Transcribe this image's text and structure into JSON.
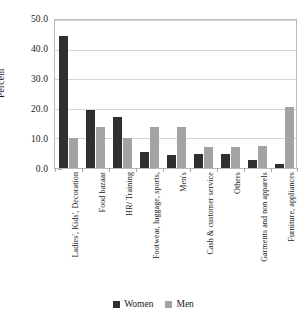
{
  "chart_data": {
    "type": "bar",
    "title": "",
    "xlabel": "",
    "ylabel": "Percent",
    "ylim": [
      0,
      50
    ],
    "ytick_step": 10,
    "ytick_labels": [
      "0.0",
      "10.0",
      "20.0",
      "30.0",
      "40.0",
      "50.0"
    ],
    "grid": true,
    "legend_position": "bottom",
    "categories": [
      "Ladies', Kids', Decoration",
      "Food bazaar",
      "HR/ Training",
      "Footwear, luggage, sports,",
      "Men's",
      "Cash & customer service",
      "Others",
      "Garments and non apparels",
      "Furniture, appliances"
    ],
    "series": [
      {
        "name": "Women",
        "color": "#2f2f2f",
        "values": [
          44.5,
          19.5,
          17.2,
          5.4,
          4.5,
          4.6,
          4.7,
          2.7,
          1.4
        ]
      },
      {
        "name": "Men",
        "color": "#a3a3a3",
        "values": [
          10.1,
          13.9,
          10.3,
          13.9,
          14.0,
          7.1,
          7.1,
          7.3,
          20.7
        ]
      }
    ]
  },
  "legend": {
    "items": [
      {
        "label": "Women",
        "swatch": "women"
      },
      {
        "label": "Men",
        "swatch": "men"
      }
    ]
  }
}
